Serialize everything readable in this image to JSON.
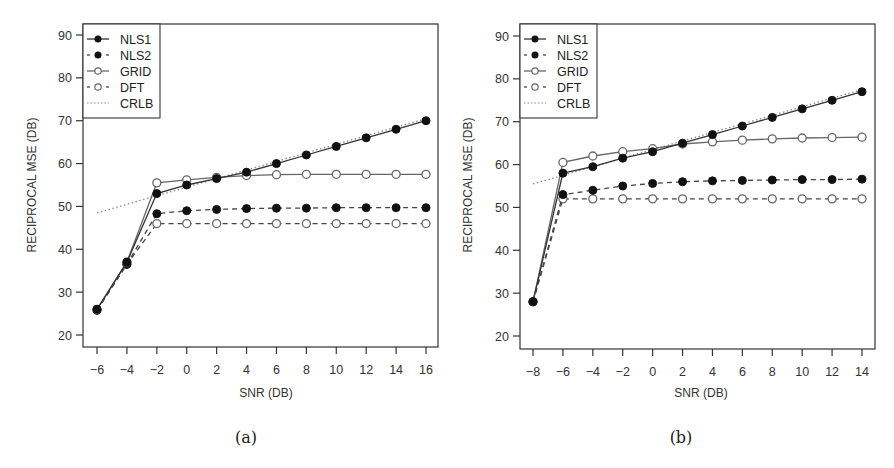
{
  "chart_data": [
    {
      "type": "line",
      "panel": "(a)",
      "xlabel": "SNR (DB)",
      "ylabel": "RECIPROCAL MSE (DB)",
      "xlim": [
        -6,
        16
      ],
      "ylim": [
        20,
        90
      ],
      "xticks": [
        -6,
        -4,
        -2,
        0,
        2,
        4,
        6,
        8,
        10,
        12,
        14,
        16
      ],
      "yticks": [
        20,
        30,
        40,
        50,
        60,
        70,
        80,
        90
      ],
      "grid": false,
      "legend_position": "top-left",
      "x": [
        -6,
        -4,
        -2,
        0,
        2,
        4,
        6,
        8,
        10,
        12,
        14,
        16
      ],
      "series": [
        {
          "name": "NLS1",
          "marker": "filled",
          "line": "solid",
          "values": [
            26,
            37,
            53,
            55,
            56.5,
            58,
            60,
            62,
            64,
            66,
            68,
            70
          ]
        },
        {
          "name": "NLS2",
          "marker": "filled",
          "line": "dashed",
          "values": [
            25.8,
            36.5,
            48.3,
            49,
            49.3,
            49.5,
            49.6,
            49.6,
            49.7,
            49.7,
            49.7,
            49.7
          ]
        },
        {
          "name": "GRID",
          "marker": "open",
          "line": "solid",
          "values": [
            26,
            37,
            55.5,
            56.2,
            56.8,
            57.2,
            57.4,
            57.5,
            57.5,
            57.5,
            57.5,
            57.5
          ]
        },
        {
          "name": "DFT",
          "marker": "open",
          "line": "dashed",
          "values": [
            25.8,
            36.5,
            46,
            46,
            46,
            46,
            46,
            46,
            46,
            46,
            46,
            46
          ]
        },
        {
          "name": "CRLB",
          "marker": "none",
          "line": "dotted",
          "x": [
            -6,
            16
          ],
          "values": [
            48.5,
            70.5
          ]
        }
      ]
    },
    {
      "type": "line",
      "panel": "(b)",
      "xlabel": "SNR (DB)",
      "ylabel": "RECIPROCAL MSE (DB)",
      "xlim": [
        -8,
        14
      ],
      "ylim": [
        20,
        90
      ],
      "xticks": [
        -8,
        -6,
        -4,
        -2,
        0,
        2,
        4,
        6,
        8,
        10,
        12,
        14
      ],
      "yticks": [
        20,
        30,
        40,
        50,
        60,
        70,
        80,
        90
      ],
      "grid": false,
      "legend_position": "top-left",
      "x": [
        -8,
        -6,
        -4,
        -2,
        0,
        2,
        4,
        6,
        8,
        10,
        12,
        14
      ],
      "series": [
        {
          "name": "NLS1",
          "marker": "filled",
          "line": "solid",
          "values": [
            28,
            58,
            59.5,
            61.5,
            63,
            65,
            67,
            69,
            71,
            73,
            75,
            77
          ]
        },
        {
          "name": "NLS2",
          "marker": "filled",
          "line": "dashed",
          "values": [
            28,
            53,
            54,
            55,
            55.6,
            56,
            56.2,
            56.3,
            56.4,
            56.5,
            56.5,
            56.6
          ]
        },
        {
          "name": "GRID",
          "marker": "open",
          "line": "solid",
          "values": [
            28,
            60.5,
            62,
            63,
            63.7,
            64.8,
            65.3,
            65.7,
            66,
            66.2,
            66.3,
            66.4
          ]
        },
        {
          "name": "DFT",
          "marker": "open",
          "line": "dashed",
          "values": [
            28,
            52,
            52,
            52,
            52,
            52,
            52,
            52,
            52,
            52,
            52,
            52
          ]
        },
        {
          "name": "CRLB",
          "marker": "none",
          "line": "dotted",
          "x": [
            -8,
            14
          ],
          "values": [
            55.5,
            77.5
          ]
        }
      ]
    }
  ],
  "legend": [
    "NLS1",
    "NLS2",
    "GRID",
    "DFT",
    "CRLB"
  ],
  "captions": [
    "(a)",
    "(b)"
  ],
  "labels": {
    "xlabel": "SNR (DB)",
    "ylabel": "RECIPROCAL MSE (DB)"
  },
  "colors": {
    "axis": "#333333",
    "filled_marker": "#111111",
    "open_marker_stroke": "#666666",
    "crlb": "#888888"
  }
}
